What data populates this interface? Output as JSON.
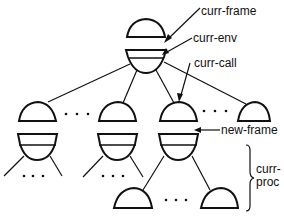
{
  "diagram": {
    "type": "frame-tree",
    "labels": {
      "curr_frame": "curr-frame",
      "curr_env": "curr-env",
      "curr_call": "curr-call",
      "new_frame": "new-frame",
      "curr_proc_line1": "curr-",
      "curr_proc_line2": "proc"
    },
    "ellipsis": "· · ·",
    "nodes": [
      {
        "id": "root",
        "parts": [
          "frame-dome",
          "env-bowl"
        ]
      },
      {
        "id": "child-1",
        "parts": [
          "frame-dome",
          "env-bowl"
        ]
      },
      {
        "id": "child-2",
        "parts": [
          "frame-dome",
          "env-bowl"
        ]
      },
      {
        "id": "child-3",
        "parts": [
          "frame-dome",
          "env-bowl"
        ],
        "note": "curr-call target"
      },
      {
        "id": "child-4",
        "parts": [
          "frame-dome"
        ]
      },
      {
        "id": "grandchild-1",
        "parts": [
          "frame-dome"
        ]
      },
      {
        "id": "grandchild-2",
        "parts": [
          "frame-dome"
        ]
      }
    ],
    "colors": {
      "stroke": "#111111",
      "background": "#ffffff"
    }
  }
}
